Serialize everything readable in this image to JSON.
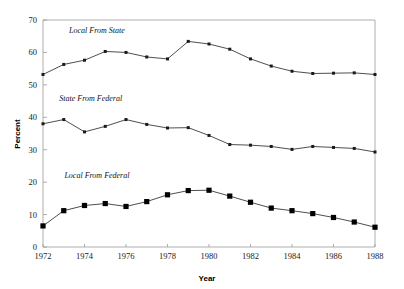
{
  "chart_data": {
    "type": "line",
    "title": "",
    "xlabel": "Year",
    "ylabel": "Percent",
    "xlim": [
      1972,
      1988
    ],
    "ylim": [
      0,
      70
    ],
    "grid": false,
    "legend_position": "inline-annotations",
    "x": [
      1972,
      1973,
      1974,
      1975,
      1976,
      1977,
      1978,
      1979,
      1980,
      1981,
      1982,
      1983,
      1984,
      1985,
      1986,
      1987,
      1988
    ],
    "xtick_labels": [
      "1972",
      "1974",
      "1976",
      "1978",
      "1980",
      "1982",
      "1984",
      "1986",
      "1988"
    ],
    "xticks": [
      1972,
      1974,
      1976,
      1978,
      1980,
      1982,
      1984,
      1986,
      1988
    ],
    "ytick_labels": [
      "0",
      "10",
      "20",
      "30",
      "40",
      "50",
      "60",
      "70"
    ],
    "yticks": [
      0,
      10,
      20,
      30,
      40,
      50,
      60,
      70
    ],
    "series": [
      {
        "name": "Local From State",
        "label": "Local From State",
        "marker": "small-square",
        "color": "#1a1a1a",
        "values": [
          53.2,
          56.3,
          57.6,
          60.3,
          60.0,
          58.6,
          58.0,
          63.4,
          62.6,
          61.0,
          58.0,
          55.8,
          54.2,
          53.5,
          53.6,
          53.7,
          53.2
        ]
      },
      {
        "name": "State From Federal",
        "label": "State From Federal",
        "marker": "small-square",
        "color": "#1a1a1a",
        "values": [
          38.0,
          39.3,
          35.5,
          37.2,
          39.3,
          37.8,
          36.7,
          36.8,
          34.4,
          31.6,
          31.4,
          31.0,
          30.1,
          31.0,
          30.7,
          30.4,
          29.3
        ]
      },
      {
        "name": "Local From Federal",
        "label": "Local From Federal",
        "marker": "big-square",
        "color": "#000000",
        "values": [
          6.5,
          11.2,
          12.8,
          13.4,
          12.5,
          14.0,
          16.1,
          17.4,
          17.5,
          15.7,
          13.8,
          12.0,
          11.2,
          10.3,
          9.1,
          7.7,
          6.1
        ]
      }
    ],
    "annotations": [
      {
        "text": "Local From State",
        "x": 1974.6,
        "y": 66.0
      },
      {
        "text": "State From Federal",
        "x": 1974.3,
        "y": 45.0
      },
      {
        "text": "Local From Federal",
        "x": 1974.6,
        "y": 21.3
      }
    ]
  }
}
